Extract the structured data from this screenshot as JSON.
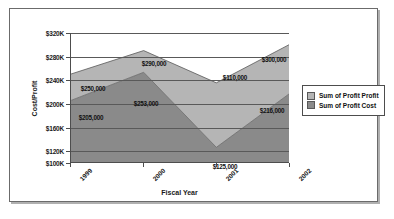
{
  "chart_data": {
    "type": "area",
    "stacked": true,
    "title": "",
    "xlabel": "Fiscal Year",
    "ylabel": "Cost/Profit",
    "categories": [
      "1999",
      "2000",
      "2001",
      "2002"
    ],
    "ylim": [
      100000,
      320000
    ],
    "yticks": [
      100000,
      120000,
      160000,
      200000,
      240000,
      280000,
      320000
    ],
    "ytick_labels": [
      "$100K",
      "$120K",
      "$160K",
      "$200K",
      "$240K",
      "$280K",
      "$320K"
    ],
    "grid": true,
    "legend_position": "right",
    "series": [
      {
        "name": "Sum of Profit Cost",
        "color": "#8a8a8a",
        "values": [
          205000,
          253000,
          125000,
          216000
        ],
        "labels": [
          "$205,000",
          "$253,000",
          "$125,000",
          "$216,000"
        ]
      },
      {
        "name": "Sum of Profit Profit",
        "color": "#b5b5b5",
        "values": [
          45000,
          37000,
          110000,
          84000
        ],
        "labels": [
          "$250,000",
          "$290,000",
          "$110,000",
          "$300,000"
        ]
      }
    ],
    "stack_tops": [
      250000,
      290000,
      235000,
      300000
    ]
  },
  "legend": {
    "items": [
      {
        "label": "Sum of Profit Profit",
        "color": "#b5b5b5"
      },
      {
        "label": "Sum of Profit Cost",
        "color": "#8a8a8a"
      }
    ]
  },
  "axes": {
    "y_title": "Cost/Profit",
    "x_title": "Fiscal Year",
    "y_ticks": [
      "$320K",
      "$280K",
      "$240K",
      "$200K",
      "$160K",
      "$120K",
      "$100K"
    ],
    "x_ticks": [
      "1999",
      "2000",
      "2001",
      "2002"
    ]
  },
  "value_labels": {
    "cost": [
      "$205,000",
      "$253,000",
      "$125,000",
      "$216,000"
    ],
    "profit": [
      "$250,000",
      "$290,000",
      "$110,000",
      "$300,000"
    ]
  }
}
